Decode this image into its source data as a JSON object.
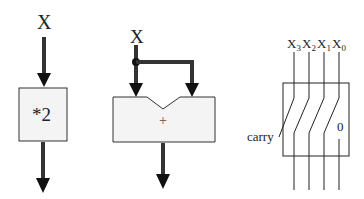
{
  "diagram": {
    "panel_multiply": {
      "input_label": "X",
      "operation_label": "*2"
    },
    "panel_add": {
      "input_label": "X",
      "operation_label": "+"
    },
    "panel_shift": {
      "bit_labels": [
        {
          "base": "X",
          "sub": "3"
        },
        {
          "base": "X",
          "sub": "2"
        },
        {
          "base": "X",
          "sub": "1"
        },
        {
          "base": "X",
          "sub": "0"
        }
      ],
      "carry_label": "carry",
      "zero_label": "0"
    },
    "colors": {
      "stroke": "#222222",
      "box_fill": "#f4f4f4",
      "thick_line": "#333333"
    }
  }
}
